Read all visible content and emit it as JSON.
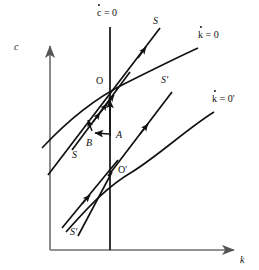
{
  "figure": {
    "type": "phase-diagram",
    "title": "",
    "axes": {
      "y_label": "c",
      "x_label": "k",
      "origin": [
        50,
        250
      ],
      "x_axis_end": [
        238,
        250
      ],
      "y_axis_top": [
        50,
        42
      ]
    },
    "loci": [
      {
        "id": "cdot-zero",
        "label_base": "c",
        "label_rest": " = 0",
        "has_dot": true,
        "kind": "vertical-line",
        "x": 110
      },
      {
        "id": "kdot-zero",
        "label_base": "k",
        "label_rest": " = 0",
        "has_dot": true,
        "kind": "concave-curve"
      },
      {
        "id": "kdot-zero-prime",
        "label_base": "k",
        "label_rest": " = 0'",
        "has_dot": true,
        "kind": "concave-curve"
      }
    ],
    "saddle_paths": [
      {
        "id": "S-upper",
        "label": "S"
      },
      {
        "id": "S-lower",
        "label": "S"
      },
      {
        "id": "Sprime-upper",
        "label": "S'"
      },
      {
        "id": "Sprime-lower",
        "label": "S'"
      }
    ],
    "points": [
      {
        "id": "O",
        "label": "O",
        "x": 110,
        "y": 88,
        "label_x": 97,
        "label_y": 80
      },
      {
        "id": "Oprime",
        "label": "O'",
        "x": 112,
        "y": 172,
        "label_x": 118,
        "label_y": 170
      },
      {
        "id": "A",
        "label": "A",
        "x": 110,
        "y": 138,
        "label_x": 117,
        "label_y": 131
      },
      {
        "id": "B",
        "label": "B",
        "x": 92,
        "y": 134,
        "label_x": 88,
        "label_y": 140
      }
    ],
    "annotations": [
      {
        "id": "arrow-A-to-B",
        "from": "A",
        "to": "B"
      },
      {
        "id": "arrow-A-up",
        "from": "A",
        "to": "O"
      }
    ],
    "colors": {
      "ink": "#111111",
      "background": "#ffffff"
    }
  }
}
